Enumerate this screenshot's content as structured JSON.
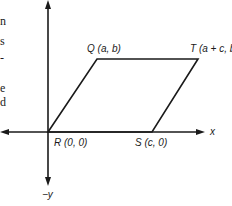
{
  "diagram": {
    "type": "coordinate-geometry",
    "axes": {
      "x_label": "x",
      "neg_y_label": "−y"
    },
    "points": {
      "Q": {
        "label": "Q (a, b)"
      },
      "T": {
        "label": "T (a + c, b)"
      },
      "R": {
        "label": "R (0, 0)"
      },
      "S": {
        "label": "S (c, 0)"
      }
    },
    "edges": [
      [
        "R",
        "Q"
      ],
      [
        "Q",
        "T"
      ],
      [
        "T",
        "S"
      ],
      [
        "S",
        "R"
      ]
    ],
    "stroke_color": "#1a1a1a",
    "background_color": "#ffffff"
  },
  "cropped_margin_text": [
    "n",
    "s",
    "-",
    "e",
    "d"
  ]
}
